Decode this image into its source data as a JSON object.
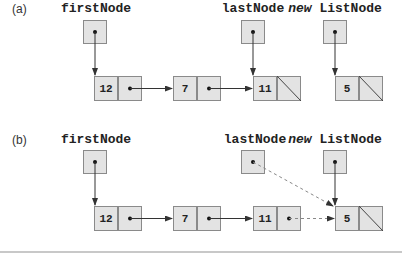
{
  "parts": [
    {
      "label": "(a)",
      "variables": {
        "first": "firstNode",
        "last": "lastNode",
        "new_kw": "new",
        "new_cls": "ListNode"
      },
      "nodes": [
        {
          "data": "12",
          "next": "pointer"
        },
        {
          "data": "7",
          "next": "pointer"
        },
        {
          "data": "11",
          "next": "null"
        },
        {
          "data": "5",
          "next": "null"
        }
      ]
    },
    {
      "label": "(b)",
      "variables": {
        "first": "firstNode",
        "last": "lastNode",
        "new_kw": "new",
        "new_cls": "ListNode"
      },
      "nodes": [
        {
          "data": "12",
          "next": "pointer"
        },
        {
          "data": "7",
          "next": "pointer"
        },
        {
          "data": "11",
          "next": "pointer (dashed, to node 5)"
        },
        {
          "data": "5",
          "next": "null"
        }
      ],
      "notes": "lastNode pointer updated (dashed) to reference new node 5"
    }
  ],
  "colors": {
    "cell_fill": "#e3e3e3",
    "cell_border": "#8a8a8a",
    "arrow": "#333333",
    "dashed_arrow": "#888888"
  }
}
